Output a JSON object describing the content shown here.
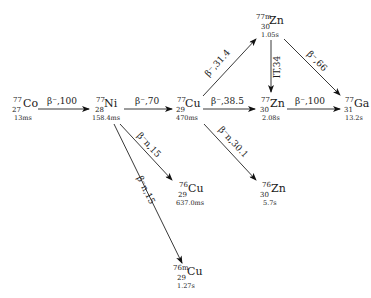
{
  "diagram": {
    "type": "decay-chain",
    "nodes": [
      {
        "id": "co77",
        "mass": "77",
        "z": "27",
        "symbol": "Co",
        "half_life": "13ms"
      },
      {
        "id": "ni77",
        "mass": "77",
        "z": "28",
        "symbol": "Ni",
        "half_life": "158.4ms"
      },
      {
        "id": "cu77",
        "mass": "77",
        "z": "29",
        "symbol": "Cu",
        "half_life": "470ms"
      },
      {
        "id": "zn77m",
        "mass": "77m",
        "z": "30",
        "symbol": "Zn",
        "half_life": "1.05s"
      },
      {
        "id": "zn77",
        "mass": "77",
        "z": "30",
        "symbol": "Zn",
        "half_life": "2.08s"
      },
      {
        "id": "ga77",
        "mass": "77",
        "z": "31",
        "symbol": "Ga",
        "half_life": "13.2s"
      },
      {
        "id": "cu76",
        "mass": "76",
        "z": "29",
        "symbol": "Cu",
        "half_life": "637.0ms"
      },
      {
        "id": "zn76",
        "mass": "76",
        "z": "30",
        "symbol": "Zn",
        "half_life": "5.7s"
      },
      {
        "id": "cu76m",
        "mass": "76m",
        "z": "29",
        "symbol": "Cu",
        "half_life": "1.27s"
      }
    ],
    "edges": [
      {
        "from": "co77",
        "to": "ni77",
        "label": "β⁻,100"
      },
      {
        "from": "ni77",
        "to": "cu77",
        "label": "β⁻,70"
      },
      {
        "from": "ni77",
        "to": "cu76",
        "label": "β⁻n,15"
      },
      {
        "from": "ni77",
        "to": "cu76m",
        "label": "β⁻n,15"
      },
      {
        "from": "cu77",
        "to": "zn77m",
        "label": "β⁻,31.4"
      },
      {
        "from": "cu77",
        "to": "zn77",
        "label": "β⁻,38.5"
      },
      {
        "from": "cu77",
        "to": "zn76",
        "label": "β⁻n,30.1"
      },
      {
        "from": "zn77m",
        "to": "zn77",
        "label": "IT,34"
      },
      {
        "from": "zn77m",
        "to": "ga77",
        "label": "β⁻,66"
      },
      {
        "from": "zn77",
        "to": "ga77",
        "label": "β⁻,100"
      }
    ]
  }
}
